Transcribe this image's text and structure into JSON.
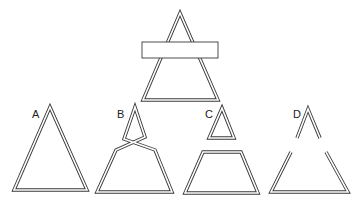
{
  "figure": {
    "stroke_color": "#3a3a3a",
    "background": "#ffffff",
    "top_stimulus": {
      "name": "occluded-triangle",
      "occluder": "horizontal-rectangle"
    },
    "options": [
      {
        "label": "A",
        "shape": "complete triangle"
      },
      {
        "label": "B",
        "shape": "twisted triangle with crossing"
      },
      {
        "label": "C",
        "shape": "small triangle above trapezoid"
      },
      {
        "label": "D",
        "shape": "inverted V above open trapezoid"
      }
    ]
  }
}
